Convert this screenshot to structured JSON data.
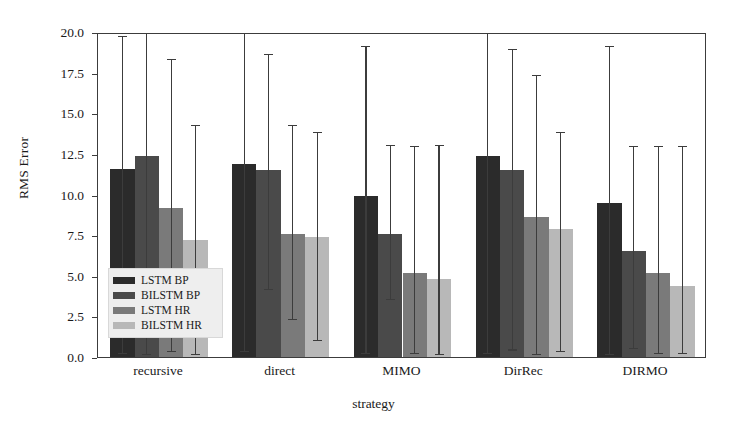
{
  "chart_data": {
    "type": "bar",
    "title": "",
    "xlabel": "strategy",
    "ylabel": "RMS Error",
    "ylim": [
      0.0,
      20.0
    ],
    "yticks": [
      "0.0",
      "2.5",
      "5.0",
      "7.5",
      "10.0",
      "12.5",
      "15.0",
      "17.5",
      "20.0"
    ],
    "ytick_values": [
      0.0,
      2.5,
      5.0,
      7.5,
      10.0,
      12.5,
      15.0,
      17.5,
      20.0
    ],
    "grid": false,
    "legend_position": "lower-left-inside",
    "categories": [
      "recursive",
      "direct",
      "MIMO",
      "DirRec",
      "DIRMO"
    ],
    "series": [
      {
        "name": "LSTM BP",
        "color": "#2b2b2b",
        "values": [
          11.6,
          11.9,
          9.9,
          12.4,
          9.5
        ],
        "err_low": [
          0.2,
          0.3,
          0.2,
          0.2,
          0.1
        ],
        "err_high": [
          19.7,
          22.5,
          19.1,
          22.0,
          19.1
        ]
      },
      {
        "name": "BILSTM BP",
        "color": "#4a4a4a",
        "values": [
          12.4,
          11.5,
          7.6,
          11.5,
          6.5
        ],
        "err_low": [
          0.1,
          4.1,
          3.5,
          0.4,
          0.5
        ],
        "err_high": [
          22.3,
          18.6,
          13.0,
          18.9,
          12.9
        ]
      },
      {
        "name": "LSTM HR",
        "color": "#7a7a7a",
        "values": [
          9.2,
          7.6,
          5.2,
          8.6,
          5.2
        ],
        "err_low": [
          0.3,
          2.3,
          0.2,
          0.1,
          0.2
        ],
        "err_high": [
          18.3,
          14.2,
          12.9,
          17.3,
          12.9
        ]
      },
      {
        "name": "BILSTM HR",
        "color": "#b8b8b8",
        "values": [
          7.2,
          7.4,
          4.8,
          7.9,
          4.4
        ],
        "err_low": [
          0.1,
          1.0,
          0.1,
          0.3,
          0.2
        ],
        "err_high": [
          14.2,
          13.8,
          13.0,
          13.8,
          12.9
        ]
      }
    ]
  },
  "axes": {
    "y_label": "RMS Error",
    "x_label": "strategy"
  }
}
